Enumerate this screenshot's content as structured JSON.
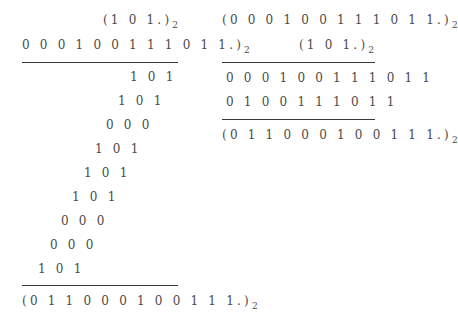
{
  "left": {
    "multiplier": "(1 0 1.)",
    "multiplicand": "0 0 0 1 0 0 1 1 1 0 1 1.)",
    "base": "2",
    "partial_products": [
      "1 0 1",
      "1 0 1",
      "0 0 0",
      "1 0 1",
      "1 0 1",
      "1 0 1",
      "0 0 0",
      "0 0 0",
      "1 0 1"
    ],
    "result": "(0 1 1 0 0 0 1 0 0 1 1 1.)"
  },
  "right": {
    "multiplicand": "(0 0 0 1 0 0 1 1 1 0 1 1.)",
    "multiplier": "(1 0 1.)",
    "base": "2",
    "partial_products": [
      "0 0 0 1 0 0 1 1 1 0 1 1",
      "0 1 0 0 1 1 1 0 1 1"
    ],
    "result": "(0 1 1 0 0 0 1 0 0 1 1 1.)"
  }
}
